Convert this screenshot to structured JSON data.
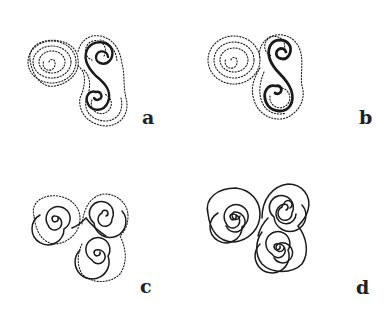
{
  "figure": {
    "panels": [
      {
        "id": "a",
        "label": "a",
        "style": "mostly dotted, bold solid S-curve through right spirals"
      },
      {
        "id": "b",
        "label": "b",
        "style": "mostly dotted, bold solid S-curve, heavier weight"
      },
      {
        "id": "c",
        "label": "c",
        "style": "solid spiral lines with dotted outer outline"
      },
      {
        "id": "d",
        "label": "d",
        "style": "all solid double-line spirals"
      }
    ]
  },
  "colors": {
    "ink": "#1a1a1a",
    "background": "#ffffff"
  }
}
